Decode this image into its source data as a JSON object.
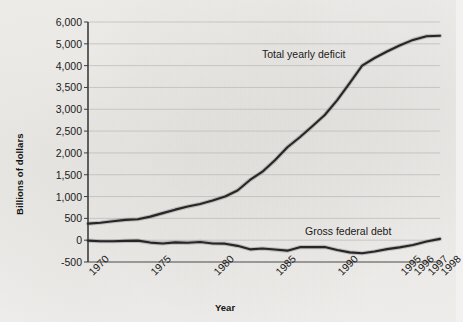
{
  "chart_data": {
    "type": "line",
    "title": "",
    "xlabel": "Year",
    "ylabel": "Billions of dollars",
    "grid": true,
    "legend_position": "inline-annotations",
    "x_tick_labels": [
      "1970",
      "1975",
      "1980",
      "1985",
      "1990",
      "1995",
      "1996",
      "1997",
      "1998"
    ],
    "y_tick_labels": [
      "6,000",
      "5,000",
      "4,000",
      "3,500",
      "3,000",
      "2,500",
      "2,000",
      "1,500",
      "1,000",
      "500",
      "0",
      "-500"
    ],
    "y_tick_values": [
      6000,
      5000,
      4000,
      3500,
      3000,
      2500,
      2000,
      1500,
      1000,
      500,
      0,
      -500
    ],
    "ylim": [
      -500,
      6000
    ],
    "xlim": [
      1970,
      1998
    ],
    "note": "Gridlines are evenly spaced although the printed tick labels are not uniformly incremented (1,000 steps above 3,500; 500 steps below).",
    "series": [
      {
        "name": "Total yearly deficit",
        "annotation": "Total yearly deficit",
        "color": "#262626",
        "x": [
          1970,
          1971,
          1972,
          1973,
          1974,
          1975,
          1976,
          1977,
          1978,
          1979,
          1980,
          1981,
          1982,
          1983,
          1984,
          1985,
          1986,
          1987,
          1988,
          1989,
          1990,
          1991,
          1992,
          1993,
          1994,
          1995,
          1996,
          1997,
          1998
        ],
        "values": [
          380,
          400,
          435,
          465,
          480,
          540,
          620,
          700,
          770,
          830,
          910,
          1000,
          1140,
          1380,
          1570,
          1830,
          2130,
          2360,
          2610,
          2870,
          3210,
          3600,
          4000,
          4350,
          4650,
          4920,
          5180,
          5350,
          5370
        ]
      },
      {
        "name": "Gross federal debt",
        "annotation": "Gross federal debt",
        "color": "#262626",
        "x": [
          1970,
          1971,
          1972,
          1973,
          1974,
          1975,
          1976,
          1977,
          1978,
          1979,
          1980,
          1981,
          1982,
          1983,
          1984,
          1985,
          1986,
          1987,
          1988,
          1989,
          1990,
          1991,
          1992,
          1993,
          1994,
          1995,
          1996,
          1997,
          1998
        ],
        "values": [
          -10,
          -25,
          -25,
          -15,
          -10,
          -55,
          -75,
          -50,
          -60,
          -40,
          -75,
          -80,
          -130,
          -210,
          -190,
          -215,
          -240,
          -160,
          -160,
          -155,
          -225,
          -280,
          -300,
          -260,
          -205,
          -165,
          -110,
          -30,
          30
        ]
      }
    ]
  }
}
